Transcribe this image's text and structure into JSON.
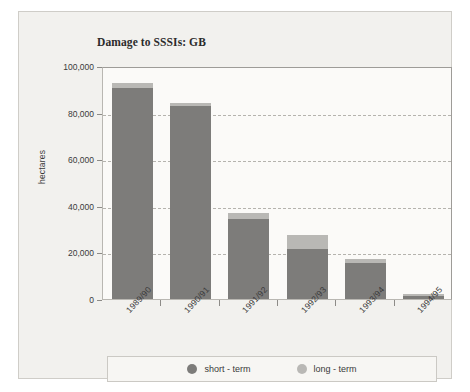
{
  "chart_data": {
    "type": "bar",
    "subtype": "stacked-vertical",
    "title": "Damage to SSSIs: GB",
    "xlabel": "",
    "ylabel": "hectares",
    "categories": [
      "1989/90",
      "1990/91",
      "1991/92",
      "1992/93",
      "1993/94",
      "1994/95"
    ],
    "series": [
      {
        "name": "short - term",
        "color": "#7d7c7a",
        "values": [
          90500,
          83000,
          34500,
          21500,
          15500,
          1500
        ]
      },
      {
        "name": "long - term",
        "color": "#b9b8b5",
        "values": [
          2000,
          1000,
          2500,
          6000,
          1500,
          500
        ]
      }
    ],
    "totals": [
      92500,
      84000,
      37000,
      27500,
      17000,
      2000
    ],
    "ylim": [
      0,
      100000
    ],
    "yticks": [
      0,
      20000,
      40000,
      60000,
      80000,
      100000
    ],
    "ytick_labels": [
      "0",
      "20,000",
      "40,000",
      "60,000",
      "80,000",
      "100,000"
    ],
    "grid": "horizontal-dashed",
    "legend_position": "bottom"
  },
  "legend": {
    "items": [
      {
        "label": "short - term",
        "color": "#7d7c7a"
      },
      {
        "label": "long - term",
        "color": "#b9b8b5"
      }
    ]
  }
}
